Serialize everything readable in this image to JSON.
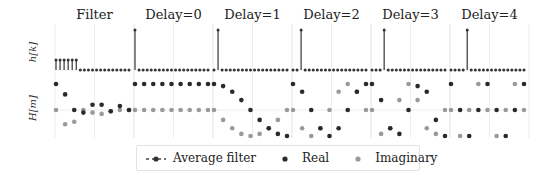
{
  "chart_data": {
    "type": "scatter",
    "layout": "2 rows x 6 columns of small multiples (stem plots top, dot plots bottom)",
    "panel_titles": [
      "Filter",
      "Delay=0",
      "Delay=1",
      "Delay=2",
      "Delay=3",
      "Delay=4"
    ],
    "row_labels": [
      "h[k]",
      "H[m]"
    ],
    "grid": true,
    "legend": {
      "position": "bottom center",
      "entries": [
        "Average filter",
        "Real",
        "Imaginary"
      ]
    },
    "colors": {
      "real": "#2a2a2a",
      "imaginary": "#9a9a9a",
      "average": "#444444",
      "grid": "#e6e6e6"
    },
    "h_k": [
      {
        "panel": "Filter",
        "values": [
          0.25,
          0.25,
          0.25,
          0.25,
          0.25,
          0.25,
          0,
          0,
          0,
          0,
          0,
          0,
          0,
          0,
          0,
          0,
          0,
          0,
          0
        ]
      },
      {
        "panel": "Delay=0",
        "values": [
          1,
          0,
          0,
          0,
          0,
          0,
          0,
          0,
          0,
          0,
          0,
          0,
          0,
          0,
          0,
          0,
          0,
          0,
          0
        ]
      },
      {
        "panel": "Delay=1",
        "values": [
          0,
          1,
          0,
          0,
          0,
          0,
          0,
          0,
          0,
          0,
          0,
          0,
          0,
          0,
          0,
          0,
          0,
          0,
          0
        ]
      },
      {
        "panel": "Delay=2",
        "values": [
          0,
          0,
          1,
          0,
          0,
          0,
          0,
          0,
          0,
          0,
          0,
          0,
          0,
          0,
          0,
          0,
          0,
          0,
          0
        ]
      },
      {
        "panel": "Delay=3",
        "values": [
          0,
          0,
          0,
          1,
          0,
          0,
          0,
          0,
          0,
          0,
          0,
          0,
          0,
          0,
          0,
          0,
          0,
          0,
          0
        ]
      },
      {
        "panel": "Delay=4",
        "values": [
          0,
          0,
          0,
          0,
          1,
          0,
          0,
          0,
          0,
          0,
          0,
          0,
          0,
          0,
          0,
          0,
          0,
          0,
          0
        ]
      }
    ],
    "H_m": [
      {
        "panel": "Filter",
        "real": [
          1.0,
          0.6,
          0.0,
          -0.1,
          0.2,
          0.2,
          -0.05,
          0.15,
          0.0
        ],
        "imag": [
          0.0,
          -0.55,
          -0.45,
          0.0,
          -0.1,
          -0.15,
          -0.05,
          0.0,
          0.0
        ]
      },
      {
        "panel": "Delay=0",
        "real": [
          1,
          1,
          1,
          1,
          1,
          1,
          1,
          1,
          1
        ],
        "imag": [
          0,
          0,
          0,
          0,
          0,
          0,
          0,
          0,
          0
        ]
      },
      {
        "panel": "Delay=1",
        "real": [
          1.0,
          0.92,
          0.7,
          0.38,
          0.0,
          -0.38,
          -0.7,
          -0.92,
          -1.0
        ],
        "imag": [
          0.0,
          -0.38,
          -0.7,
          -0.92,
          -1.0,
          -0.92,
          -0.7,
          -0.38,
          0.0
        ]
      },
      {
        "panel": "Delay=2",
        "real": [
          1.0,
          0.7,
          0.0,
          -0.7,
          -1.0,
          -0.7,
          0.0,
          0.7,
          1.0
        ],
        "imag": [
          0.0,
          -0.7,
          -1.0,
          -0.7,
          0.0,
          0.7,
          1.0,
          0.7,
          0.0
        ]
      },
      {
        "panel": "Delay=3",
        "real": [
          1.0,
          0.38,
          -0.7,
          -0.92,
          0.0,
          0.92,
          0.7,
          -0.38,
          -1.0
        ],
        "imag": [
          0.0,
          -0.92,
          -0.7,
          0.38,
          1.0,
          0.38,
          -0.7,
          -0.92,
          0.0
        ]
      },
      {
        "panel": "Delay=4",
        "real": [
          1.0,
          0.0,
          -1.0,
          0.0,
          1.0,
          0.0,
          -1.0,
          0.0,
          1.0
        ],
        "imag": [
          0.0,
          -1.0,
          0.0,
          1.0,
          0.0,
          -1.0,
          0.0,
          1.0,
          0.0
        ]
      }
    ]
  },
  "figure": {
    "titles": [
      "Filter",
      "Delay=0",
      "Delay=1",
      "Delay=2",
      "Delay=3",
      "Delay=4"
    ],
    "ylabel_top": "h[k]",
    "ylabel_bottom": "H[m]"
  },
  "legend": {
    "average_label": "Average filter",
    "real_label": "Real",
    "imag_label": "Imaginary"
  }
}
